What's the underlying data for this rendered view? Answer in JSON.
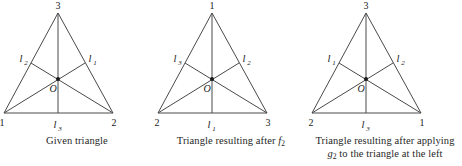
{
  "figure": {
    "background": "#ffffff",
    "line_color": "#4a4a4a",
    "text_color": "#1a1a1a",
    "panel_count": 3
  },
  "panels": [
    {
      "id": "given-triangle",
      "apex_label": "3",
      "bottom_left_label": "1",
      "bottom_right_label": "2",
      "left_line_label": "l",
      "left_line_sub": "2",
      "right_line_label": "l",
      "right_line_sub": "1",
      "bottom_line_label": "l",
      "bottom_line_sub": "3",
      "center_label": "O",
      "caption_line1_pre": "Given triangle",
      "caption_line1_ital": "",
      "caption_line1_sub": "",
      "caption_line1_post": "",
      "caption_line2_pre": "",
      "caption_line2_ital": "",
      "caption_line2_sub": "",
      "caption_line2_post": ""
    },
    {
      "id": "triangle-after-f2",
      "apex_label": "1",
      "bottom_left_label": "2",
      "bottom_right_label": "3",
      "left_line_label": "l",
      "left_line_sub": "3",
      "right_line_label": "l",
      "right_line_sub": "2",
      "bottom_line_label": "l",
      "bottom_line_sub": "1",
      "center_label": "O",
      "caption_line1_pre": "Triangle resulting after ",
      "caption_line1_ital": "f",
      "caption_line1_sub": "2",
      "caption_line1_post": "",
      "caption_line2_pre": "",
      "caption_line2_ital": "",
      "caption_line2_sub": "",
      "caption_line2_post": ""
    },
    {
      "id": "triangle-after-g2",
      "apex_label": "3",
      "bottom_left_label": "2",
      "bottom_right_label": "1",
      "left_line_label": "l",
      "left_line_sub": "1",
      "right_line_label": "l",
      "right_line_sub": "2",
      "bottom_line_label": "l",
      "bottom_line_sub": "3",
      "center_label": "O",
      "caption_line1_pre": "Triangle resulting after applying",
      "caption_line1_ital": "",
      "caption_line1_sub": "",
      "caption_line1_post": "",
      "caption_line2_pre": "",
      "caption_line2_ital": "g",
      "caption_line2_sub": "2",
      "caption_line2_post": " to the triangle at the left"
    }
  ]
}
